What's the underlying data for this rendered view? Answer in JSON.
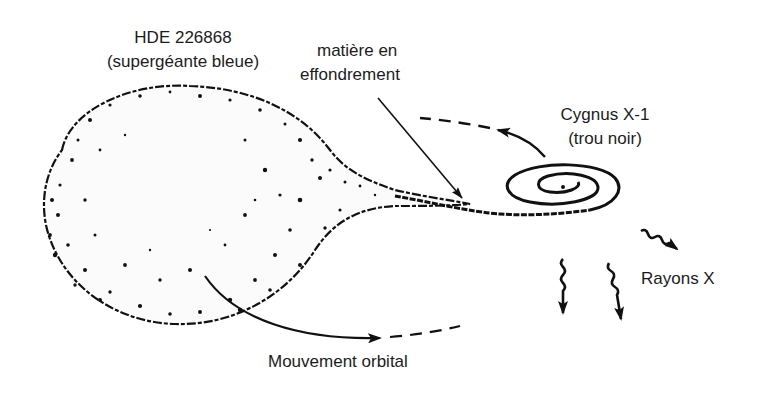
{
  "diagram": {
    "labels": {
      "star_name": "HDE 226868",
      "star_type": "(supergéante bleue)",
      "matter_line1": "matière en",
      "matter_line2": "effondrement",
      "bh_name": "Cygnus X-1",
      "bh_type": "(trou noir)",
      "xrays": "Rayons X",
      "orbital": "Mouvement orbital"
    },
    "colors": {
      "ink": "#111111",
      "background": "#ffffff"
    }
  }
}
